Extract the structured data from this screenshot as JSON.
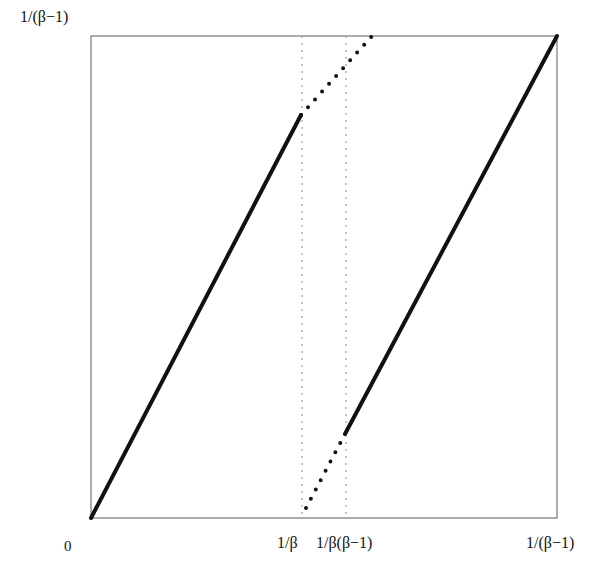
{
  "figure": {
    "type": "piecewise-linear map plot",
    "y_axis_labels": {
      "top": "1/(β−1)"
    },
    "x_axis_labels": [
      {
        "text": "0",
        "pos": 0
      },
      {
        "text": "1/β",
        "pos": "1/β"
      },
      {
        "text": "1/β(β−1)",
        "pos": "1/β(β−1)"
      },
      {
        "text": "1/(β−1)",
        "pos": "1/(β−1)"
      }
    ],
    "frame_px": {
      "left": 91,
      "right": 557,
      "top": 36,
      "bottom": 518
    },
    "dashed_verticals_px": [
      302,
      346
    ],
    "segments": [
      {
        "style": "solid",
        "from_px": [
          91,
          518
        ],
        "to_px": [
          301,
          115
        ]
      },
      {
        "style": "dotted",
        "from_px": [
          301,
          115
        ],
        "to_px": [
          372,
          36
        ]
      },
      {
        "style": "dotted",
        "from_px": [
          306,
          508
        ],
        "to_px": [
          345,
          434
        ]
      },
      {
        "style": "solid",
        "from_px": [
          345,
          434
        ],
        "to_px": [
          557,
          36
        ]
      }
    ]
  },
  "labels": {
    "y_top": "1/(β−1)",
    "x0": "0",
    "x1": "1/β",
    "x2": "1/β(β−1)",
    "x3": "1/(β−1)"
  }
}
